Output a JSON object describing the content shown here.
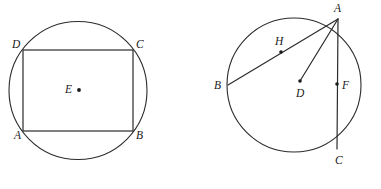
{
  "figure": {
    "background_color": "#ffffff",
    "stroke_color": "#2b2b2b",
    "label_color": "#1a1a1a",
    "width": 381,
    "height": 189
  },
  "left_figure": {
    "name": "rectangle-inscribed-in-circle",
    "circle": {
      "cx": 78,
      "cy": 90.5,
      "r": 69
    },
    "rectangle": {
      "x": 23,
      "y": 50,
      "width": 110,
      "height": 81
    },
    "labels": {
      "a": "A",
      "b": "B",
      "c": "C",
      "d": "D",
      "e": "E"
    },
    "label_positions": {
      "a": {
        "x": 14,
        "y": 139
      },
      "b": {
        "x": 136,
        "y": 139
      },
      "c": {
        "x": 136,
        "y": 48
      },
      "d": {
        "x": 12,
        "y": 48
      },
      "e": {
        "x": 65,
        "y": 93
      }
    },
    "points": {
      "A": {
        "x": 23,
        "y": 131
      },
      "B": {
        "x": 133,
        "y": 131
      },
      "C": {
        "x": 133,
        "y": 50
      },
      "D": {
        "x": 23,
        "y": 50
      },
      "E": {
        "x": 79,
        "y": 90
      }
    }
  },
  "right_figure": {
    "name": "chords-and-center-in-circle",
    "circle": {
      "cx": 294,
      "cy": 85,
      "r": 67
    },
    "labels": {
      "a": "A",
      "b": "B",
      "c": "C",
      "d": "D",
      "f": "F",
      "h": "H"
    },
    "label_positions": {
      "a": {
        "x": 334,
        "y": 12
      },
      "b": {
        "x": 214,
        "y": 89
      },
      "c": {
        "x": 335,
        "y": 164
      },
      "d": {
        "x": 296,
        "y": 97
      },
      "f": {
        "x": 342,
        "y": 89
      },
      "h": {
        "x": 275,
        "y": 45
      }
    },
    "points": {
      "A": {
        "x": 338,
        "y": 19
      },
      "B": {
        "x": 228,
        "y": 85
      },
      "C": {
        "x": 337,
        "y": 149
      },
      "D": {
        "x": 300,
        "y": 81
      },
      "F": {
        "x": 337,
        "y": 84
      },
      "H": {
        "x": 281,
        "y": 52
      }
    },
    "segments": [
      {
        "name": "chord-AB",
        "from": "A",
        "to": "B"
      },
      {
        "name": "chord-AC",
        "from": "A",
        "to": "C"
      },
      {
        "name": "radius-AD",
        "from": "A",
        "to": "D"
      }
    ]
  }
}
